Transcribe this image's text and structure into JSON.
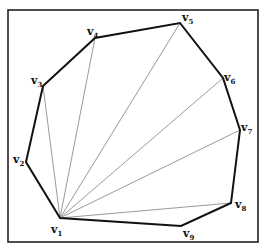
{
  "diagram": {
    "type": "polygon-fan-triangulation",
    "frame": {
      "x": 8,
      "y": 10,
      "width": 250,
      "height": 232,
      "stroke": "#222222"
    },
    "polygon_stroke": "#111111",
    "diagonal_stroke": "#9a9a9a",
    "apex": "v1",
    "vertices": [
      {
        "id": "v1",
        "letter": "v",
        "index": "1",
        "x": 60,
        "y": 218,
        "lx": 51,
        "ly": 233
      },
      {
        "id": "v2",
        "letter": "v",
        "index": "2",
        "x": 26,
        "y": 162,
        "lx": 13,
        "ly": 163
      },
      {
        "id": "v3",
        "letter": "v",
        "index": "3",
        "x": 43,
        "y": 86,
        "lx": 31,
        "ly": 84
      },
      {
        "id": "v4",
        "letter": "v",
        "index": "4",
        "x": 95,
        "y": 38,
        "lx": 87,
        "ly": 35
      },
      {
        "id": "v5",
        "letter": "v",
        "index": "5",
        "x": 180,
        "y": 23,
        "lx": 182,
        "ly": 21
      },
      {
        "id": "v6",
        "letter": "v",
        "index": "6",
        "x": 223,
        "y": 78,
        "lx": 224,
        "ly": 81
      },
      {
        "id": "v7",
        "letter": "v",
        "index": "7",
        "x": 240,
        "y": 130,
        "lx": 241,
        "ly": 131
      },
      {
        "id": "v8",
        "letter": "v",
        "index": "8",
        "x": 231,
        "y": 203,
        "lx": 235,
        "ly": 208
      },
      {
        "id": "v9",
        "letter": "v",
        "index": "9",
        "x": 181,
        "y": 226,
        "lx": 183,
        "ly": 237
      }
    ],
    "diagonals": [
      [
        "v1",
        "v3"
      ],
      [
        "v1",
        "v4"
      ],
      [
        "v1",
        "v5"
      ],
      [
        "v1",
        "v6"
      ],
      [
        "v1",
        "v7"
      ],
      [
        "v1",
        "v8"
      ]
    ]
  }
}
